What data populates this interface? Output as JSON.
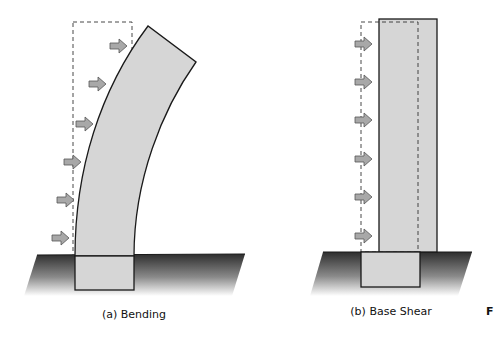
{
  "panels": [
    {
      "id": "a",
      "caption": "(a)  Bending",
      "load_arrows": 6,
      "deformation": "bending"
    },
    {
      "id": "b",
      "caption": "(b)  Base Shear",
      "load_arrows": 6,
      "deformation": "base-shear"
    }
  ],
  "cutoff_label": "F",
  "colors": {
    "column_fill": "#d6d6d6",
    "outline": "#1a1a1a",
    "arrow_fill": "#a8a8a8",
    "arrow_stroke": "#555555",
    "ground_dark": "#3a3a3a",
    "ground_light": "#ffffff",
    "dashed": "#333333"
  }
}
